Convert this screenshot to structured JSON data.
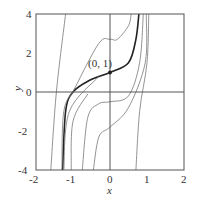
{
  "chart_data": {
    "type": "line",
    "title": "",
    "xlabel": "x",
    "ylabel": "y",
    "xlim": [
      -2,
      2
    ],
    "ylim": [
      -4,
      4
    ],
    "xticks": [
      "-2",
      "-1",
      "0",
      "1",
      "2"
    ],
    "yticks": [
      "4",
      "2",
      "0",
      "-2",
      "-4"
    ],
    "grid": false,
    "annotation": {
      "label": "(0, 1)",
      "x": 0,
      "y": 1
    },
    "highlighted_series": "solution through (0, 1)",
    "series": [
      {
        "name": "solution through (0, 1)",
        "bold": true,
        "points": [
          [
            -1.28,
            -4
          ],
          [
            -1.2,
            -1
          ],
          [
            -1.0,
            0
          ],
          [
            -0.55,
            0.6
          ],
          [
            0,
            1
          ],
          [
            0.5,
            1.5
          ],
          [
            0.7,
            2.7
          ],
          [
            0.78,
            4
          ]
        ]
      },
      {
        "name": "curve a",
        "points": [
          [
            -1.6,
            -4
          ],
          [
            -1.45,
            0
          ],
          [
            -1.2,
            4
          ]
        ]
      },
      {
        "name": "curve b",
        "points": [
          [
            -1.3,
            -4
          ],
          [
            -1.25,
            -1
          ],
          [
            -0.95,
            0.2
          ],
          [
            -0.3,
            2.5
          ],
          [
            0,
            2.7
          ],
          [
            0.2,
            2.7
          ],
          [
            0.5,
            3.4
          ],
          [
            0.57,
            4
          ]
        ]
      },
      {
        "name": "curve c",
        "points": [
          [
            -1.25,
            -4
          ],
          [
            -1.1,
            -1
          ],
          [
            -0.3,
            0.8
          ]
        ]
      },
      {
        "name": "curve d",
        "points": [
          [
            -0.75,
            -4
          ],
          [
            -0.6,
            -1.3
          ],
          [
            -0.3,
            -0.6
          ],
          [
            0,
            -0.5
          ],
          [
            0.5,
            -0.2
          ],
          [
            0.8,
            1.5
          ],
          [
            0.9,
            4
          ]
        ]
      },
      {
        "name": "curve e",
        "points": [
          [
            -0.45,
            -4
          ],
          [
            -0.3,
            -2.3
          ],
          [
            0,
            -1.8
          ],
          [
            0.5,
            -0.8
          ],
          [
            0.95,
            1.5
          ],
          [
            0.98,
            4
          ]
        ]
      },
      {
        "name": "curve f",
        "points": [
          [
            0.7,
            -4
          ],
          [
            0.8,
            -1
          ],
          [
            1.0,
            1.5
          ],
          [
            1.05,
            4
          ]
        ]
      },
      {
        "name": "curve g",
        "points": [
          [
            -1.05,
            -4
          ],
          [
            -1.0,
            -1.5
          ],
          [
            -0.6,
            -0.1
          ]
        ]
      }
    ]
  }
}
